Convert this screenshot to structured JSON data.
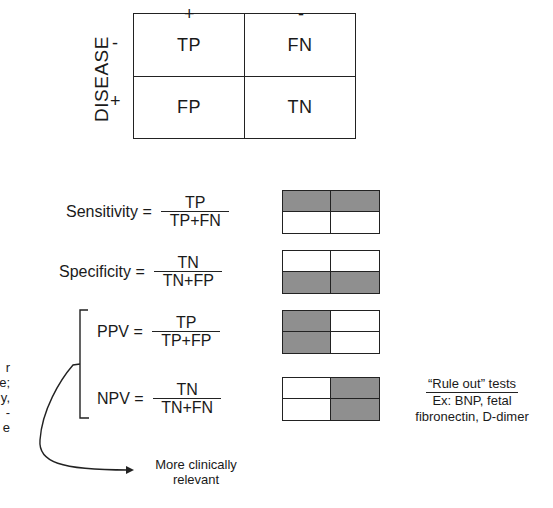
{
  "contingency_table": {
    "row_axis_label": "DISEASE",
    "column_headers": [
      "+",
      "-"
    ],
    "row_headers": [
      "-",
      "+"
    ],
    "cells": [
      [
        "TP",
        "FN"
      ],
      [
        "FP",
        "TN"
      ]
    ]
  },
  "formulas": [
    {
      "name": "Sensitivity = ",
      "numerator": "TP",
      "denominator": "TP+FN",
      "shaded": [
        true,
        true,
        false,
        false
      ]
    },
    {
      "name": "Specificity = ",
      "numerator": "TN",
      "denominator": "TN+FP",
      "shaded": [
        false,
        false,
        true,
        true
      ]
    },
    {
      "name": "PPV = ",
      "numerator": "TP",
      "denominator": "TP+FP",
      "shaded": [
        true,
        false,
        true,
        false
      ]
    },
    {
      "name": "NPV = ",
      "numerator": "TN",
      "denominator": "TN+FN",
      "shaded": [
        false,
        true,
        false,
        true
      ]
    }
  ],
  "bracket_note": {
    "line1": "More clinically",
    "line2": "relevant"
  },
  "rule_out": {
    "title": "“Rule out” tests",
    "line2": "Ex: BNP, fetal",
    "line3": "fibronectin, D-dimer"
  },
  "clipped_left_text": [
    "r",
    "e;",
    "y,",
    "-",
    "e"
  ],
  "colors": {
    "line": "#222222",
    "shade": "#8f8f8f",
    "background": "#ffffff"
  }
}
